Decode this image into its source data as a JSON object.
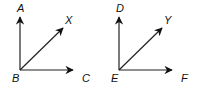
{
  "diagram": {
    "type": "geometry-angles",
    "figures": [
      {
        "name": "angle-ABC",
        "vertex": {
          "label": "B",
          "x": 20,
          "y": 70
        },
        "rays": [
          {
            "label": "A",
            "tip": [
              20,
              17
            ],
            "label_pos": [
              17,
              12
            ]
          },
          {
            "label": "X",
            "tip": [
              63,
              28
            ],
            "label_pos": [
              65,
              24
            ]
          },
          {
            "label": "C",
            "tip": [
              73,
              70
            ],
            "label_pos": [
              82,
              82
            ]
          }
        ],
        "vertex_label_pos": [
          12,
          82
        ]
      },
      {
        "name": "angle-DEF",
        "vertex": {
          "label": "E",
          "x": 119,
          "y": 70
        },
        "rays": [
          {
            "label": "D",
            "tip": [
              119,
              17
            ],
            "label_pos": [
              116,
              12
            ]
          },
          {
            "label": "Y",
            "tip": [
              162,
              28
            ],
            "label_pos": [
              164,
              24
            ]
          },
          {
            "label": "F",
            "tip": [
              172,
              70
            ],
            "label_pos": [
              181,
              82
            ]
          }
        ],
        "vertex_label_pos": [
          111,
          82
        ]
      }
    ],
    "colors": {
      "stroke": "#222222",
      "label": "#111111",
      "background": "#ffffff"
    }
  }
}
